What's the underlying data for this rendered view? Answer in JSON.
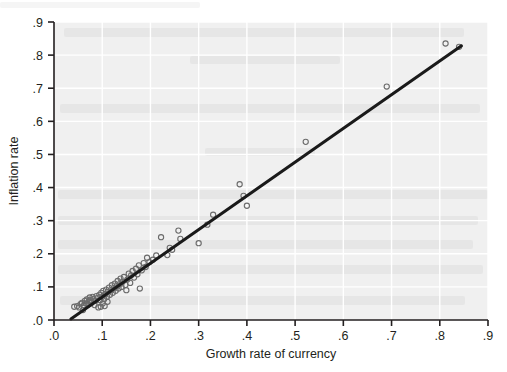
{
  "chart_data": {
    "type": "scatter",
    "title": "",
    "subtitle": "",
    "xlabel": "Growth rate of currency",
    "ylabel": "Inflation rate",
    "xlim": [
      0.0,
      0.9
    ],
    "ylim": [
      0.0,
      0.9
    ],
    "xticks": [
      0.0,
      0.1,
      0.2,
      0.3,
      0.4,
      0.5,
      0.6,
      0.7,
      0.8,
      0.9
    ],
    "yticks": [
      0.0,
      0.1,
      0.2,
      0.3,
      0.4,
      0.5,
      0.6,
      0.7,
      0.8,
      0.9
    ],
    "xtick_labels": [
      ".0",
      ".1",
      ".2",
      ".3",
      ".4",
      ".5",
      ".6",
      ".7",
      ".8",
      ".9"
    ],
    "ytick_labels": [
      ".0",
      ".1",
      ".2",
      ".3",
      ".4",
      ".5",
      ".6",
      ".7",
      ".8",
      ".9"
    ],
    "grid": true,
    "grid_color": "#ffffff",
    "plot_background": "#f0f0f0",
    "legend": null,
    "legend_position": "none",
    "marker": {
      "style": "open-circle",
      "radius": 2.6,
      "stroke": "#6b6b6b",
      "fill": "none",
      "stroke_width": 1.1
    },
    "series": [
      {
        "name": "Countries",
        "type": "scatter",
        "points": [
          [
            0.042,
            0.04
          ],
          [
            0.048,
            0.042
          ],
          [
            0.052,
            0.038
          ],
          [
            0.055,
            0.048
          ],
          [
            0.058,
            0.052
          ],
          [
            0.06,
            0.03
          ],
          [
            0.062,
            0.044
          ],
          [
            0.064,
            0.058
          ],
          [
            0.066,
            0.05
          ],
          [
            0.068,
            0.062
          ],
          [
            0.07,
            0.046
          ],
          [
            0.072,
            0.056
          ],
          [
            0.074,
            0.068
          ],
          [
            0.076,
            0.06
          ],
          [
            0.078,
            0.052
          ],
          [
            0.08,
            0.07
          ],
          [
            0.082,
            0.064
          ],
          [
            0.084,
            0.045
          ],
          [
            0.086,
            0.058
          ],
          [
            0.088,
            0.072
          ],
          [
            0.09,
            0.066
          ],
          [
            0.092,
            0.038
          ],
          [
            0.094,
            0.076
          ],
          [
            0.096,
            0.06
          ],
          [
            0.097,
            0.04
          ],
          [
            0.098,
            0.082
          ],
          [
            0.1,
            0.07
          ],
          [
            0.101,
            0.05
          ],
          [
            0.102,
            0.088
          ],
          [
            0.104,
            0.063
          ],
          [
            0.105,
            0.042
          ],
          [
            0.106,
            0.078
          ],
          [
            0.108,
            0.092
          ],
          [
            0.11,
            0.07
          ],
          [
            0.111,
            0.055
          ],
          [
            0.112,
            0.085
          ],
          [
            0.114,
            0.098
          ],
          [
            0.116,
            0.076
          ],
          [
            0.118,
            0.09
          ],
          [
            0.12,
            0.105
          ],
          [
            0.122,
            0.082
          ],
          [
            0.124,
            0.096
          ],
          [
            0.126,
            0.11
          ],
          [
            0.128,
            0.088
          ],
          [
            0.13,
            0.102
          ],
          [
            0.132,
            0.118
          ],
          [
            0.134,
            0.095
          ],
          [
            0.136,
            0.108
          ],
          [
            0.138,
            0.125
          ],
          [
            0.14,
            0.1
          ],
          [
            0.142,
            0.115
          ],
          [
            0.145,
            0.13
          ],
          [
            0.148,
            0.106
          ],
          [
            0.15,
            0.09
          ],
          [
            0.152,
            0.122
          ],
          [
            0.155,
            0.14
          ],
          [
            0.158,
            0.112
          ],
          [
            0.16,
            0.135
          ],
          [
            0.163,
            0.148
          ],
          [
            0.166,
            0.128
          ],
          [
            0.17,
            0.155
          ],
          [
            0.173,
            0.138
          ],
          [
            0.176,
            0.165
          ],
          [
            0.178,
            0.095
          ],
          [
            0.182,
            0.15
          ],
          [
            0.186,
            0.172
          ],
          [
            0.19,
            0.16
          ],
          [
            0.193,
            0.188
          ],
          [
            0.198,
            0.175
          ],
          [
            0.205,
            0.182
          ],
          [
            0.212,
            0.195
          ],
          [
            0.222,
            0.25
          ],
          [
            0.235,
            0.196
          ],
          [
            0.24,
            0.218
          ],
          [
            0.245,
            0.212
          ],
          [
            0.258,
            0.27
          ],
          [
            0.262,
            0.245
          ],
          [
            0.3,
            0.232
          ],
          [
            0.318,
            0.288
          ],
          [
            0.33,
            0.318
          ],
          [
            0.385,
            0.41
          ],
          [
            0.393,
            0.375
          ],
          [
            0.4,
            0.345
          ],
          [
            0.522,
            0.538
          ],
          [
            0.69,
            0.705
          ],
          [
            0.812,
            0.835
          ],
          [
            0.84,
            0.825
          ]
        ]
      }
    ],
    "fit_line": {
      "name": "Regression line",
      "type": "line",
      "color": "#1a1a1a",
      "width": 3.0,
      "x_start": 0.035,
      "y_start": 0.003,
      "x_end": 0.845,
      "y_end": 0.828
    }
  },
  "axes": {
    "x_axis_name": "Growth rate of currency",
    "y_axis_name": "Inflation rate"
  }
}
